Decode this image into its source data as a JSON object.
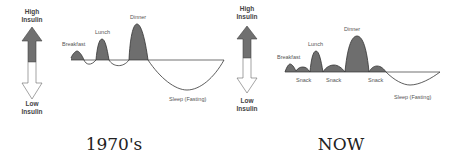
{
  "colors": {
    "peak_fill": "#6e6e6e",
    "line": "#333333",
    "arrow_dark": "#707070",
    "arrow_light": "#ffffff",
    "text": "#555555"
  },
  "axis": {
    "high_line1": "High",
    "high_line2": "Insulin",
    "low_line1": "Low",
    "low_line2": "Insulin"
  },
  "panels": [
    {
      "caption": "1970's",
      "labels": {
        "breakfast": "Breakfast",
        "lunch": "Lunch",
        "dinner": "Dinner",
        "sleep": "Sleep (Fasting)"
      }
    },
    {
      "caption": "NOW",
      "labels": {
        "breakfast": "Breakfast",
        "lunch": "Lunch",
        "dinner": "Dinner",
        "snack1": "Snack",
        "snack2": "Snack",
        "snack3": "Snack",
        "sleep": "Sleep (Fasting)"
      }
    }
  ]
}
